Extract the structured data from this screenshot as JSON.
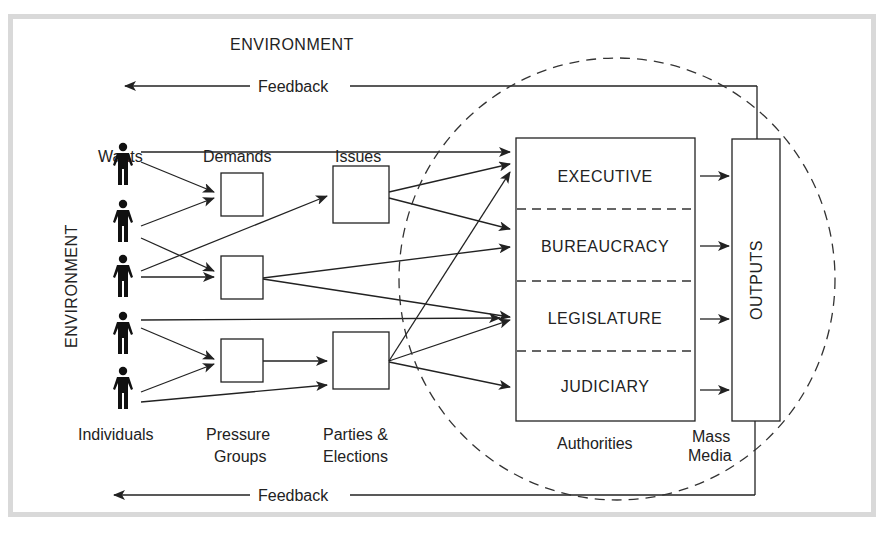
{
  "diagram": {
    "type": "political-system-flow",
    "colors": {
      "line": "#222222",
      "dash": "#333333",
      "frame": "#d9d9d9",
      "figure": "#111111"
    },
    "environment_top": "ENVIRONMENT",
    "environment_left": "ENVIRONMENT",
    "feedback_top": "Feedback",
    "feedback_bottom": "Feedback",
    "column_headers": {
      "wants": "Wants",
      "demands": "Demands",
      "issues": "Issues"
    },
    "column_footers": {
      "individuals": "Individuals",
      "pressure_groups_1": "Pressure",
      "pressure_groups_2": "Groups",
      "parties_1": "Parties &",
      "parties_2": "Elections",
      "authorities": "Authorities",
      "mass_media_1": "Mass",
      "mass_media_2": "Media"
    },
    "individuals": [
      {
        "icon": "person-icon"
      },
      {
        "icon": "person-icon"
      },
      {
        "icon": "person-icon"
      },
      {
        "icon": "person-icon"
      },
      {
        "icon": "person-icon"
      }
    ],
    "authorities": [
      "EXECUTIVE",
      "BUREAUCRACY",
      "LEGISLATURE",
      "JUDICIARY"
    ],
    "outputs": "OUTPUTS"
  }
}
